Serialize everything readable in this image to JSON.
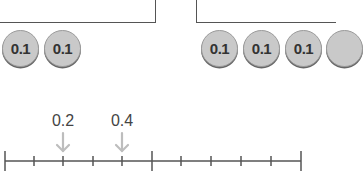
{
  "left_group": {
    "chips": [
      {
        "value": "0.1"
      },
      {
        "value": "0.1"
      }
    ]
  },
  "right_group": {
    "chips": [
      {
        "value": "0.1"
      },
      {
        "value": "0.1"
      },
      {
        "value": "0.1"
      },
      {
        "value": ""
      }
    ]
  },
  "number_line": {
    "start": 0,
    "end": 1,
    "divisions": 10,
    "markers": [
      {
        "label": "0.2",
        "value": 0.2
      },
      {
        "label": "0.4",
        "value": 0.4
      }
    ],
    "colors": {
      "line": "#555555",
      "arrow": "#bdbdbd"
    }
  }
}
